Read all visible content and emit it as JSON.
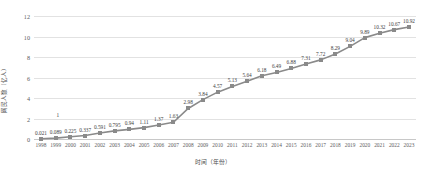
{
  "chart_data": {
    "type": "line",
    "title": "",
    "xlabel": "时间（年份）",
    "ylabel": "网民人数（亿人）",
    "categories": [
      "1998",
      "1999",
      "2000",
      "2001",
      "2002",
      "2003",
      "2004",
      "2005",
      "2006",
      "2007",
      "2008",
      "2009",
      "2010",
      "2011",
      "2012",
      "2013",
      "2014",
      "2015",
      "2016",
      "2017",
      "2018",
      "2019",
      "2020",
      "2021",
      "2022",
      "2023"
    ],
    "values": [
      0.021,
      0.089,
      0.225,
      0.337,
      0.591,
      0.795,
      0.94,
      1.11,
      1.37,
      1.63,
      2.98,
      3.84,
      4.57,
      5.13,
      5.64,
      6.18,
      6.49,
      6.88,
      7.31,
      7.72,
      8.29,
      9.04,
      9.89,
      10.32,
      10.67,
      10.92
    ],
    "point_labels": [
      "0.021",
      "0.089",
      "0.225",
      "0.337",
      "0.591",
      "0.795",
      "0.94",
      "1.11",
      "1.37",
      "1.63",
      "2.98",
      "3.84",
      "4.57",
      "5.13",
      "5.64",
      "6.18",
      "6.49",
      "6.88",
      "7.31",
      "7.72",
      "8.29",
      "9.04",
      "9.89",
      "10.32",
      "10.67",
      "10.92"
    ],
    "ylim": [
      0,
      12
    ],
    "yticks": [
      "0",
      "2",
      "4",
      "6",
      "8",
      "10",
      "12"
    ],
    "grid": true,
    "legend": false,
    "series_color": "#8a8a8a",
    "gridline_color": "#e2e2e2",
    "annotations": [
      "1"
    ]
  }
}
